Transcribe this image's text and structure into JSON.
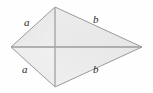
{
  "figure": {
    "name": "kite-quadrilateral-with-diagonals",
    "background_color": "#fefefe",
    "fill_color": "#e8e8e8",
    "fill_color_light": "#ededed",
    "outline_color": "#9a9a9a",
    "diagonal_color": "#9d9d9d",
    "label_color": "#2b2b2b",
    "vertices": {
      "left": {
        "x": 11,
        "y": 47
      },
      "top": {
        "x": 55,
        "y": 7
      },
      "right": {
        "x": 142,
        "y": 47
      },
      "bottom": {
        "x": 55,
        "y": 87
      }
    },
    "diagonal_intersection": {
      "x": 55,
      "y": 47
    },
    "labels": {
      "upper_left": "a",
      "upper_right": "b",
      "lower_left": "a",
      "lower_right": "b"
    }
  }
}
